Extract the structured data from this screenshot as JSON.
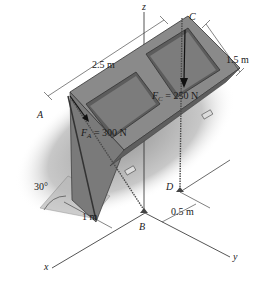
{
  "figure": {
    "type": "statics 3D free-body diagram",
    "axes": {
      "x": "x",
      "y": "y",
      "z": "z"
    },
    "points": {
      "A": "A",
      "B": "B",
      "C": "C",
      "D": "D"
    },
    "forces": {
      "FA": {
        "symbol": "F",
        "subscript": "A",
        "value": "= 300 N"
      },
      "FC": {
        "symbol": "F",
        "subscript": "C",
        "value": "= 250 N"
      }
    },
    "dimensions": {
      "length": "2.5 m",
      "width": "1.5 m",
      "x_offset": "1 m",
      "y_offset": "0.5 m",
      "angle": "30°"
    },
    "colors": {
      "panel_dark": "#6e6e6e",
      "panel_mid": "#8c8c8c",
      "panel_light": "#a9a9a9",
      "shadow": "#bdbdbd",
      "line": "#2a2a2a"
    }
  }
}
